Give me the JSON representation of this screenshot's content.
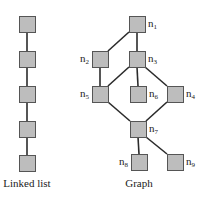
{
  "linked_list": {
    "caption": "Linked list",
    "nodes": [
      {
        "x": 19,
        "y": 16
      },
      {
        "x": 19,
        "y": 51
      },
      {
        "x": 19,
        "y": 86
      },
      {
        "x": 19,
        "y": 121
      },
      {
        "x": 19,
        "y": 155
      }
    ]
  },
  "graph": {
    "caption": "Graph",
    "nodes": [
      {
        "id": "n1",
        "base": "n",
        "sub": "1",
        "x": 129,
        "y": 16,
        "label_side": "right"
      },
      {
        "id": "n2",
        "base": "n",
        "sub": "2",
        "x": 92,
        "y": 51,
        "label_side": "left"
      },
      {
        "id": "n3",
        "base": "n",
        "sub": "3",
        "x": 129,
        "y": 51,
        "label_side": "right"
      },
      {
        "id": "n4",
        "base": "n",
        "sub": "4",
        "x": 167,
        "y": 86,
        "label_side": "right"
      },
      {
        "id": "n5",
        "base": "n",
        "sub": "5",
        "x": 92,
        "y": 86,
        "label_side": "left"
      },
      {
        "id": "n6",
        "base": "n",
        "sub": "6",
        "x": 130,
        "y": 86,
        "label_side": "right"
      },
      {
        "id": "n7",
        "base": "n",
        "sub": "7",
        "x": 130,
        "y": 121,
        "label_side": "right"
      },
      {
        "id": "n8",
        "base": "n",
        "sub": "8",
        "x": 131,
        "y": 154,
        "label_side": "left"
      },
      {
        "id": "n9",
        "base": "n",
        "sub": "9",
        "x": 167,
        "y": 154,
        "label_side": "right"
      }
    ],
    "edges": [
      [
        "n1",
        "n2"
      ],
      [
        "n1",
        "n3"
      ],
      [
        "n2",
        "n5"
      ],
      [
        "n3",
        "n5"
      ],
      [
        "n3",
        "n6"
      ],
      [
        "n3",
        "n4"
      ],
      [
        "n5",
        "n7"
      ],
      [
        "n4",
        "n7"
      ],
      [
        "n7",
        "n8"
      ],
      [
        "n7",
        "n9"
      ]
    ]
  },
  "style": {
    "node_fill": "#bdbdbd",
    "node_stroke": "#555555",
    "edge_color": "#2b2b2b",
    "node_size": 16
  }
}
